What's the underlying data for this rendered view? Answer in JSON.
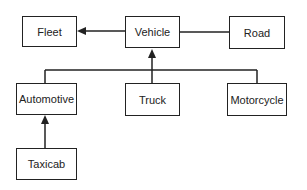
{
  "diagram": {
    "type": "class-hierarchy",
    "nodes": {
      "fleet": "Fleet",
      "vehicle": "Vehicle",
      "road": "Road",
      "automotive": "Automotive",
      "truck": "Truck",
      "motorcycle": "Motorcycle",
      "taxicab": "Taxicab"
    },
    "edges": [
      {
        "from": "Vehicle",
        "to": "Fleet",
        "style": "arrow"
      },
      {
        "from": "Vehicle",
        "to": "Road",
        "style": "line"
      },
      {
        "from": "Automotive",
        "to": "Vehicle",
        "style": "arrow"
      },
      {
        "from": "Truck",
        "to": "Vehicle",
        "style": "arrow"
      },
      {
        "from": "Motorcycle",
        "to": "Vehicle",
        "style": "arrow"
      },
      {
        "from": "Taxicab",
        "to": "Automotive",
        "style": "arrow"
      }
    ]
  }
}
